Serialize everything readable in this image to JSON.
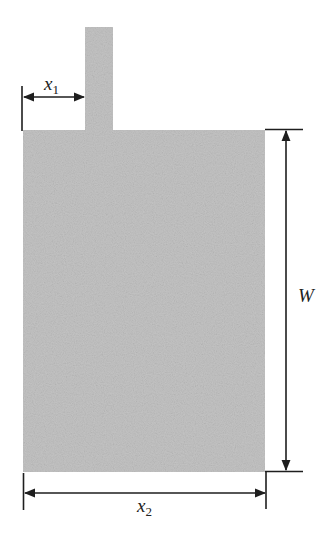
{
  "diagram": {
    "colors": {
      "patch_fill": "#c4c4c4",
      "line": "#1e1e1e",
      "background": "#ffffff"
    },
    "labels": {
      "x1": {
        "base": "x",
        "sub": "1"
      },
      "x2": {
        "base": "x",
        "sub": "2"
      },
      "W": {
        "base": "W"
      }
    },
    "components": [
      {
        "name": "feed-line",
        "x": 85,
        "y": 27,
        "width": 28,
        "height": 104
      },
      {
        "name": "patch",
        "x": 23,
        "y": 130,
        "width": 242,
        "height": 342
      }
    ],
    "dimensions": [
      {
        "name": "x1",
        "from": 23,
        "to": 85,
        "axis": "horizontal",
        "at": 97
      },
      {
        "name": "x2",
        "from": 23,
        "to": 265,
        "axis": "horizontal",
        "at": 493
      },
      {
        "name": "W",
        "from": 130,
        "to": 472,
        "axis": "vertical",
        "at": 286
      }
    ]
  }
}
